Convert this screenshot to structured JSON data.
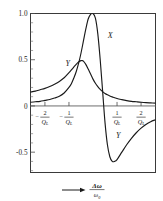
{
  "chart_data": {
    "type": "line",
    "title": "",
    "xlabel": "Δω / ω₀",
    "ylabel": "",
    "xlim": [
      -2.6,
      2.6
    ],
    "ylim": [
      -0.72,
      1.0
    ],
    "grid": false,
    "legend_position": "inline-curve-labels",
    "x_tick_labels": [
      "-2/Q_L",
      "-1/Q_L",
      "1/Q_L",
      "2/Q_L"
    ],
    "x_tick_values": [
      -2,
      -1,
      1,
      2
    ],
    "y_tick_labels": [
      "1.0",
      "0.5",
      "0",
      "-0.5"
    ],
    "y_tick_values": [
      1.0,
      0.5,
      0.0,
      -0.5
    ],
    "y_minor_step": 0.1,
    "x_axis_note": "x is normalized detuning in units of 1/Q_L",
    "series": [
      {
        "name": "X",
        "label": "X",
        "description": "In-phase resonance component, peaks at 1.0 at zero detuning then swings negative",
        "x": [
          -2.6,
          -2.4,
          -2.2,
          -2.0,
          -1.8,
          -1.6,
          -1.4,
          -1.2,
          -1.0,
          -0.9,
          -0.8,
          -0.7,
          -0.6,
          -0.5,
          -0.4,
          -0.3,
          -0.2,
          -0.1,
          0.0,
          0.1,
          0.2,
          0.3,
          0.4,
          0.5,
          0.6,
          0.7,
          0.8,
          0.9,
          1.0,
          1.2,
          1.4,
          1.6,
          1.8,
          2.0,
          2.2,
          2.4,
          2.6
        ],
        "y": [
          0.04,
          0.045,
          0.05,
          0.06,
          0.07,
          0.085,
          0.105,
          0.14,
          0.2,
          0.24,
          0.3,
          0.37,
          0.46,
          0.57,
          0.7,
          0.83,
          0.94,
          0.99,
          1.0,
          0.95,
          0.78,
          0.5,
          0.16,
          -0.18,
          -0.42,
          -0.55,
          -0.6,
          -0.6,
          -0.58,
          -0.5,
          -0.42,
          -0.35,
          -0.29,
          -0.24,
          -0.2,
          -0.17,
          -0.15
        ]
      },
      {
        "name": "Y",
        "label": "Y",
        "description": "Quadrature component, rises to about 0.5 near -0.5/Q_L then falls toward zero",
        "x": [
          -2.6,
          -2.4,
          -2.2,
          -2.0,
          -1.8,
          -1.6,
          -1.4,
          -1.2,
          -1.0,
          -0.9,
          -0.8,
          -0.7,
          -0.6,
          -0.5,
          -0.45,
          -0.4,
          -0.3,
          -0.2,
          -0.1,
          0.0,
          0.1,
          0.2,
          0.3,
          0.4,
          0.5,
          0.6,
          0.7,
          0.8,
          1.0,
          1.2,
          1.4,
          1.6,
          1.8,
          2.0,
          2.2,
          2.4,
          2.6
        ],
        "y": [
          0.15,
          0.16,
          0.175,
          0.19,
          0.21,
          0.235,
          0.265,
          0.305,
          0.36,
          0.39,
          0.42,
          0.45,
          0.475,
          0.49,
          0.49,
          0.485,
          0.45,
          0.4,
          0.345,
          0.29,
          0.245,
          0.21,
          0.18,
          0.155,
          0.135,
          0.12,
          0.108,
          0.098,
          0.08,
          0.068,
          0.058,
          0.05,
          0.045,
          0.04,
          0.036,
          0.033,
          0.03
        ]
      }
    ],
    "curve_labels": [
      {
        "text": "X",
        "x": 0.72,
        "y": 0.74
      },
      {
        "text": "Y",
        "x": -1.05,
        "y": 0.43
      },
      {
        "text": "Y",
        "x": 1.05,
        "y": -0.35
      }
    ],
    "x_axis_caption": {
      "numerator": "Δω",
      "denominator": "ω",
      "denominator_sub": "0",
      "has_arrow": true
    },
    "tick_denominator": "Q",
    "tick_denominator_sub": "L",
    "colors": {
      "curve": "#1a1a1a",
      "frame": "#3a3a3a",
      "zeroline": "#6e6e6e",
      "background": "#ffffff"
    }
  }
}
